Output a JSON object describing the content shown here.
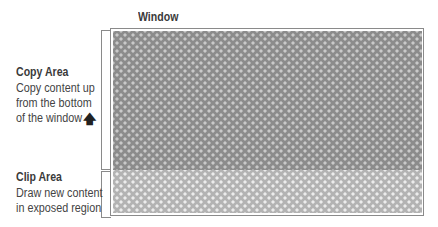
{
  "diagram": {
    "window_label": "Window",
    "copy_area": {
      "title": "Copy Area",
      "lines": [
        "Copy content up",
        "from the bottom",
        "of the window"
      ],
      "arrow_icon": "arrow-up-icon"
    },
    "clip_area": {
      "title": "Clip Area",
      "lines": [
        "Draw new content",
        "in exposed region"
      ]
    },
    "colors": {
      "copy_region_fill": "#8c8c8c",
      "clip_region_fill": "#b3b3b3",
      "frame_stroke": "#8a8a8a"
    }
  }
}
